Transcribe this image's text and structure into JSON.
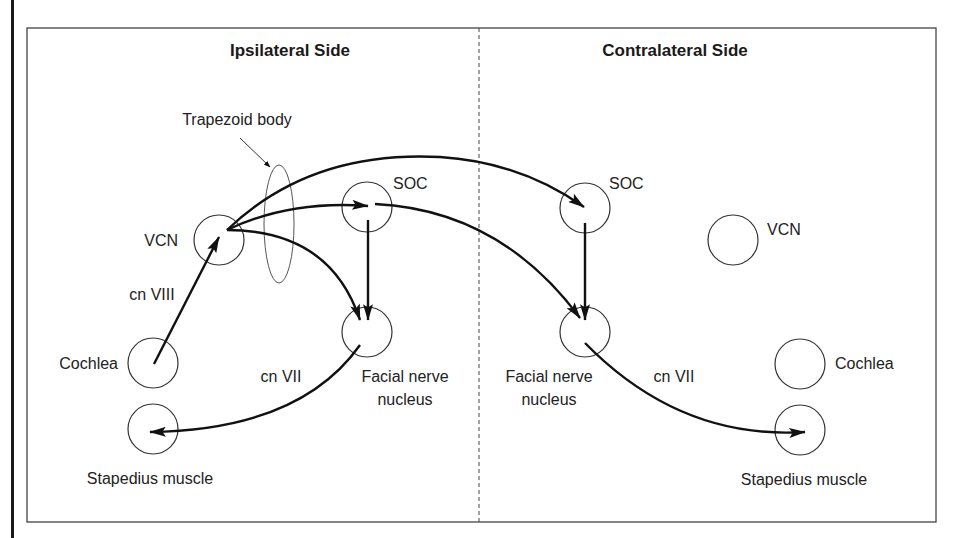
{
  "diagram": {
    "type": "acoustic reflex pathway",
    "sides": {
      "ipsilateral": {
        "title": "Ipsilateral Side"
      },
      "contralateral": {
        "title": "Contralateral Side"
      }
    },
    "annotation": {
      "trapezoid_body": "Trapezoid body"
    },
    "nodes": {
      "ipsi_vcn": "VCN",
      "ipsi_soc": "SOC",
      "ipsi_facial_line1": "Facial nerve",
      "ipsi_facial_line2": "nucleus",
      "ipsi_cochlea": "Cochlea",
      "ipsi_stapedius": "Stapedius muscle",
      "contra_soc": "SOC",
      "contra_vcn": "VCN",
      "contra_facial_line1": "Facial nerve",
      "contra_facial_line2": "nucleus",
      "contra_cochlea": "Cochlea",
      "contra_stapedius": "Stapedius muscle"
    },
    "edge_labels": {
      "cn_viii": "cn VIII",
      "ipsi_cn_vii": "cn VII",
      "contra_cn_vii": "cn VII"
    },
    "edges": [
      {
        "from": "Cochlea (ipsi)",
        "to": "VCN (ipsi)",
        "label": "cn VIII"
      },
      {
        "from": "VCN (ipsi)",
        "to": "SOC (ipsi)"
      },
      {
        "from": "VCN (ipsi)",
        "to": "Facial nerve nucleus (ipsi)"
      },
      {
        "from": "VCN (ipsi)",
        "to": "SOC (contra)"
      },
      {
        "from": "SOC (ipsi)",
        "to": "Facial nerve nucleus (ipsi)"
      },
      {
        "from": "SOC (ipsi)",
        "to": "Facial nerve nucleus (contra)"
      },
      {
        "from": "SOC (contra)",
        "to": "Facial nerve nucleus (contra)"
      },
      {
        "from": "Facial nerve nucleus (ipsi)",
        "to": "Stapedius muscle (ipsi)",
        "label": "cn VII"
      },
      {
        "from": "Facial nerve nucleus (contra)",
        "to": "Stapedius muscle (contra)",
        "label": "cn VII"
      }
    ]
  }
}
